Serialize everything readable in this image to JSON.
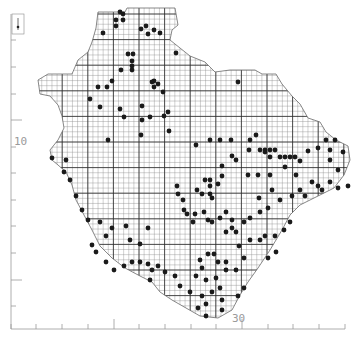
{
  "map": {
    "type": "grid distribution map",
    "colors": {
      "background": "#ffffff",
      "grid_fine": "#8a8a8a",
      "grid_major": "#2a2a2a",
      "outline": "#6a6a6a",
      "dot": "#1a1a1a",
      "axis": "#9a9a9a"
    },
    "axes": {
      "left_label": "10",
      "bottom_label": "30",
      "left_ticks_y": [
        40,
        67,
        94,
        120,
        147,
        173,
        200,
        226,
        253,
        280,
        306
      ],
      "bottom_ticks_x": [
        11,
        36,
        62,
        88,
        114,
        139,
        165,
        191,
        216,
        242,
        268,
        293,
        319,
        345
      ]
    },
    "grid": {
      "fine_step": 5.12,
      "major_step": 25.6,
      "origin_x": 11,
      "origin_y": 14
    },
    "outline_points": "98,12 125,12 127,8 175,8 178,25 172,30 170,40 180,48 190,56 205,62 215,72 230,70 255,70 262,74 276,74 282,84 292,96 300,104 308,118 320,122 326,132 336,140 348,146 350,160 344,175 334,188 320,195 300,205 290,215 282,230 270,250 258,268 248,282 240,295 232,310 218,318 200,316 186,308 172,300 160,292 152,282 140,276 125,268 112,258 100,246 92,230 84,215 76,200 72,185 66,172 58,165 52,160 50,150 58,140 64,128 62,116 58,105 50,96 40,94 38,80 48,74 72,74 78,60 88,52 92,42 96,28",
    "dots": [
      [
        120,
        12
      ],
      [
        123,
        14
      ],
      [
        116,
        20
      ],
      [
        123,
        20
      ],
      [
        116,
        26
      ],
      [
        141,
        29
      ],
      [
        146,
        26
      ],
      [
        154,
        30
      ],
      [
        148,
        34
      ],
      [
        160,
        33
      ],
      [
        103,
        33
      ],
      [
        176,
        53
      ],
      [
        133,
        54
      ],
      [
        128,
        54
      ],
      [
        132,
        61
      ],
      [
        132,
        66
      ],
      [
        132,
        70
      ],
      [
        121,
        70
      ],
      [
        112,
        81
      ],
      [
        107,
        87
      ],
      [
        98,
        87
      ],
      [
        152,
        82
      ],
      [
        158,
        84
      ],
      [
        154,
        81
      ],
      [
        154,
        87
      ],
      [
        238,
        82
      ],
      [
        163,
        92
      ],
      [
        168,
        112
      ],
      [
        164,
        116
      ],
      [
        150,
        117
      ],
      [
        124,
        117
      ],
      [
        90,
        99
      ],
      [
        100,
        107
      ],
      [
        120,
        109
      ],
      [
        142,
        106
      ],
      [
        142,
        120
      ],
      [
        169,
        131
      ],
      [
        141,
        135
      ],
      [
        196,
        145
      ],
      [
        210,
        140
      ],
      [
        220,
        140
      ],
      [
        231,
        140
      ],
      [
        250,
        140
      ],
      [
        256,
        135
      ],
      [
        249,
        150
      ],
      [
        260,
        150
      ],
      [
        265,
        150
      ],
      [
        270,
        150
      ],
      [
        275,
        150
      ],
      [
        265,
        152
      ],
      [
        270,
        157
      ],
      [
        280,
        157
      ],
      [
        285,
        157
      ],
      [
        290,
        157
      ],
      [
        295,
        157
      ],
      [
        308,
        151
      ],
      [
        300,
        161
      ],
      [
        285,
        167
      ],
      [
        270,
        175
      ],
      [
        258,
        175
      ],
      [
        248,
        175
      ],
      [
        232,
        156
      ],
      [
        236,
        160
      ],
      [
        222,
        166
      ],
      [
        222,
        176
      ],
      [
        218,
        184
      ],
      [
        205,
        180
      ],
      [
        210,
        180
      ],
      [
        210,
        186
      ],
      [
        210,
        194
      ],
      [
        197,
        190
      ],
      [
        202,
        194
      ],
      [
        212,
        198
      ],
      [
        177,
        186
      ],
      [
        178,
        194
      ],
      [
        183,
        200
      ],
      [
        184,
        210
      ],
      [
        187,
        214
      ],
      [
        195,
        214
      ],
      [
        204,
        212
      ],
      [
        208,
        220
      ],
      [
        193,
        222
      ],
      [
        212,
        222
      ],
      [
        220,
        218
      ],
      [
        226,
        212
      ],
      [
        232,
        220
      ],
      [
        232,
        228
      ],
      [
        226,
        232
      ],
      [
        236,
        232
      ],
      [
        244,
        222
      ],
      [
        250,
        218
      ],
      [
        260,
        212
      ],
      [
        268,
        208
      ],
      [
        280,
        200
      ],
      [
        292,
        196
      ],
      [
        300,
        190
      ],
      [
        305,
        196
      ],
      [
        312,
        182
      ],
      [
        318,
        186
      ],
      [
        322,
        190
      ],
      [
        330,
        182
      ],
      [
        338,
        188
      ],
      [
        348,
        186
      ],
      [
        338,
        170
      ],
      [
        330,
        160
      ],
      [
        330,
        150
      ],
      [
        326,
        140
      ],
      [
        335,
        140
      ],
      [
        343,
        152
      ],
      [
        318,
        148
      ],
      [
        296,
        175
      ],
      [
        272,
        190
      ],
      [
        259,
        198
      ],
      [
        239,
        246
      ],
      [
        250,
        240
      ],
      [
        260,
        240
      ],
      [
        265,
        236
      ],
      [
        275,
        236
      ],
      [
        284,
        230
      ],
      [
        290,
        222
      ],
      [
        276,
        252
      ],
      [
        268,
        258
      ],
      [
        244,
        258
      ],
      [
        236,
        270
      ],
      [
        226,
        270
      ],
      [
        226,
        262
      ],
      [
        218,
        262
      ],
      [
        214,
        254
      ],
      [
        208,
        254
      ],
      [
        200,
        260
      ],
      [
        202,
        268
      ],
      [
        196,
        276
      ],
      [
        206,
        280
      ],
      [
        216,
        278
      ],
      [
        220,
        288
      ],
      [
        212,
        292
      ],
      [
        202,
        296
      ],
      [
        190,
        292
      ],
      [
        180,
        286
      ],
      [
        175,
        276
      ],
      [
        165,
        272
      ],
      [
        158,
        266
      ],
      [
        152,
        270
      ],
      [
        150,
        280
      ],
      [
        148,
        264
      ],
      [
        140,
        262
      ],
      [
        132,
        262
      ],
      [
        124,
        266
      ],
      [
        114,
        270
      ],
      [
        106,
        262
      ],
      [
        96,
        252
      ],
      [
        92,
        245
      ],
      [
        106,
        236
      ],
      [
        112,
        228
      ],
      [
        100,
        222
      ],
      [
        126,
        226
      ],
      [
        148,
        228
      ],
      [
        140,
        244
      ],
      [
        130,
        240
      ],
      [
        88,
        220
      ],
      [
        82,
        210
      ],
      [
        76,
        196
      ],
      [
        70,
        180
      ],
      [
        64,
        172
      ],
      [
        66,
        160
      ],
      [
        108,
        140
      ],
      [
        52,
        158
      ],
      [
        198,
        308
      ],
      [
        206,
        304
      ],
      [
        222,
        300
      ],
      [
        238,
        296
      ],
      [
        222,
        310
      ],
      [
        206,
        316
      ],
      [
        244,
        288
      ]
    ]
  }
}
